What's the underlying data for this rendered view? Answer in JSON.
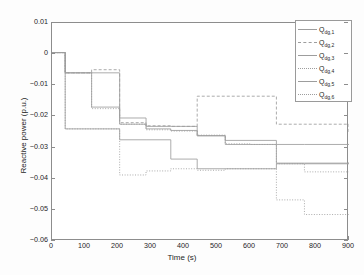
{
  "chart_data": {
    "type": "line",
    "subtype": "staircase",
    "title": "",
    "xlabel": "Time (s)",
    "ylabel": "Reactive power (p.u.)",
    "xlim": [
      0,
      900
    ],
    "ylim": [
      -0.06,
      0.01
    ],
    "xticks": [
      0,
      100,
      200,
      300,
      400,
      500,
      600,
      700,
      800,
      900
    ],
    "xtick_labels": [
      "0",
      "100",
      "200",
      "300",
      "400",
      "500",
      "600",
      "700",
      "800",
      "900"
    ],
    "yticks": [
      0.01,
      0,
      -0.01,
      -0.02,
      -0.03,
      -0.04,
      -0.05,
      -0.06
    ],
    "ytick_labels": [
      "0.01",
      "0",
      "−0.01",
      "−0.02",
      "−0.03",
      "−0.04",
      "−0.05",
      "−0.06"
    ],
    "grid": false,
    "legend_position": "top-right",
    "line_color": "#9d9d9d",
    "series": [
      {
        "name": "Q_dg,1",
        "label_base": "Q",
        "label_sub": "dg,1",
        "dash": "solid",
        "x": [
          0,
          40,
          120,
          205,
          285,
          360,
          440,
          525,
          600,
          680,
          765,
          900
        ],
        "y": [
          0.0005,
          -0.006,
          -0.006,
          -0.0225,
          -0.0232,
          -0.0232,
          -0.0262,
          -0.0277,
          -0.0277,
          -0.029,
          -0.029,
          -0.029
        ]
      },
      {
        "name": "Q_dg,2",
        "label_base": "Q",
        "label_sub": "dg,2",
        "dash": "dashed",
        "x": [
          0,
          40,
          120,
          205,
          285,
          360,
          440,
          525,
          600,
          680,
          765,
          900
        ],
        "y": [
          0.0005,
          -0.006,
          -0.005,
          -0.022,
          -0.023,
          -0.0232,
          -0.0135,
          -0.0135,
          -0.0135,
          -0.0225,
          -0.0225,
          -0.0256
        ]
      },
      {
        "name": "Q_dg,3",
        "label_base": "Q",
        "label_sub": "dg,3",
        "dash": "solid",
        "x": [
          0,
          40,
          120,
          205,
          285,
          360,
          440,
          525,
          600,
          680,
          765,
          900
        ],
        "y": [
          0.0005,
          -0.006,
          -0.017,
          -0.0205,
          -0.024,
          -0.0245,
          -0.0262,
          -0.029,
          -0.029,
          -0.035,
          -0.035,
          -0.0348
        ]
      },
      {
        "name": "Q_dg,4",
        "label_base": "Q",
        "label_sub": "dg,4",
        "dash": "dotted",
        "x": [
          0,
          40,
          120,
          205,
          285,
          360,
          440,
          525,
          600,
          680,
          765,
          900
        ],
        "y": [
          0.0005,
          -0.006,
          -0.0175,
          -0.0225,
          -0.0243,
          -0.0247,
          -0.026,
          -0.0288,
          -0.029,
          -0.0352,
          -0.0378,
          -0.0378
        ]
      },
      {
        "name": "Q_dg,5",
        "label_base": "Q",
        "label_sub": "dg,5",
        "dash": "solid",
        "x": [
          0,
          40,
          120,
          205,
          285,
          360,
          440,
          525,
          600,
          680,
          765,
          900
        ],
        "y": [
          0.0005,
          -0.024,
          -0.024,
          -0.0275,
          -0.0275,
          -0.0337,
          -0.0368,
          -0.0368,
          -0.0368,
          -0.0352,
          -0.0352,
          -0.0352
        ]
      },
      {
        "name": "Q_dg,6",
        "label_base": "Q",
        "label_sub": "dg,6",
        "dash": "dotted",
        "x": [
          0,
          40,
          120,
          205,
          285,
          360,
          440,
          525,
          600,
          680,
          765,
          900
        ],
        "y": [
          0.0005,
          -0.024,
          -0.024,
          -0.0388,
          -0.0375,
          -0.0368,
          -0.0373,
          -0.0368,
          -0.0368,
          -0.0468,
          -0.0515,
          -0.0515
        ]
      }
    ]
  },
  "legend": {
    "entries": [
      {
        "base": "Q",
        "sub": "dg,1"
      },
      {
        "base": "Q",
        "sub": "dg,2"
      },
      {
        "base": "Q",
        "sub": "dg,3"
      },
      {
        "base": "Q",
        "sub": "dg,4"
      },
      {
        "base": "Q",
        "sub": "dg,5"
      },
      {
        "base": "Q",
        "sub": "dg,6"
      }
    ]
  }
}
